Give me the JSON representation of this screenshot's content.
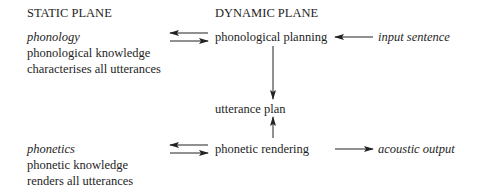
{
  "static_plane": {
    "heading": "STATIC PLANE",
    "phonology": {
      "term": "phonology",
      "line1": "phonological knowledge",
      "line2": "characterises all utterances"
    },
    "phonetics": {
      "term": "phonetics",
      "line1": "phonetic knowledge",
      "line2": "renders all utterances"
    }
  },
  "dynamic_plane": {
    "heading": "DYNAMIC PLANE",
    "phonological_planning": "phonological planning",
    "utterance_plan": "utterance plan",
    "phonetic_rendering": "phonetic rendering"
  },
  "inputs_outputs": {
    "input": "input sentence",
    "output": "acoustic output"
  },
  "colors": {
    "text": "#1e1e1e",
    "arrow": "#222222",
    "background": "#ffffff"
  }
}
